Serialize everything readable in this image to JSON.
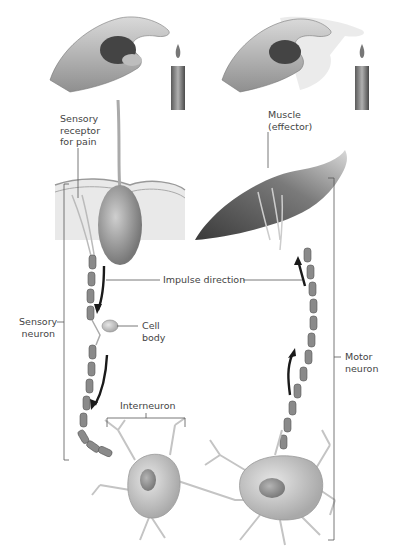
{
  "labels": {
    "sensory_receptor": [
      "Sensory",
      "receptor",
      "for pain"
    ],
    "muscle": [
      "Muscle",
      "(effector)"
    ],
    "impulse_direction": "Impulse direction",
    "sensory_neuron": [
      "Sensory",
      "neuron"
    ],
    "cell_body": [
      "Cell",
      "body"
    ],
    "motor_neuron": [
      "Motor",
      "neuron"
    ],
    "interneuron": "Interneuron"
  },
  "colors": {
    "line": "#555555",
    "text": "#444444",
    "arrow": "#1a1a1a",
    "tissue": "#b8b8b8"
  }
}
